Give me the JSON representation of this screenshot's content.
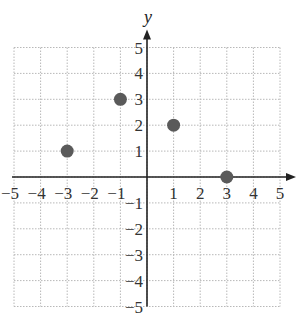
{
  "chart_data": {
    "type": "scatter",
    "title": "",
    "xlabel": "",
    "ylabel": "y",
    "xlim": [
      -5,
      5
    ],
    "ylim": [
      -5,
      5
    ],
    "grid": true,
    "x_ticks": [
      -5,
      -4,
      -3,
      -2,
      -1,
      1,
      2,
      3,
      4,
      5
    ],
    "y_ticks": [
      -5,
      -4,
      -3,
      -2,
      -1,
      1,
      2,
      3,
      4,
      5
    ],
    "x_tick_labels": [
      "−5",
      "−4",
      "−3",
      "−2",
      "−1",
      "1",
      "2",
      "3",
      "4",
      "5"
    ],
    "y_tick_labels": [
      "−5",
      "−4",
      "−3",
      "−2",
      "−1",
      "1",
      "2",
      "3",
      "4",
      "5"
    ],
    "points": [
      {
        "x": -3,
        "y": 1
      },
      {
        "x": -1,
        "y": 3
      },
      {
        "x": 1,
        "y": 2
      },
      {
        "x": 3,
        "y": 0
      }
    ],
    "colors": {
      "point": "#5a5a5a",
      "axis": "#222222",
      "grid": "#b8b8b8"
    }
  }
}
